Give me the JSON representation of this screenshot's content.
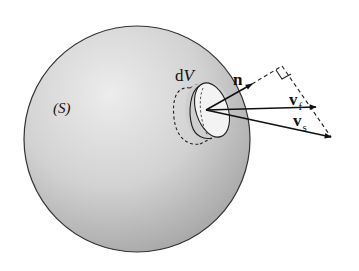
{
  "figure": {
    "labels": {
      "surface": "(S)",
      "volume_element_d": "d",
      "volume_element_v": "V",
      "normal": "n",
      "fluid_velocity": "v",
      "fluid_velocity_sub": "f",
      "surface_velocity": "v",
      "surface_velocity_sub": "s"
    },
    "colors": {
      "sphere_fill_light": "#e6e6e6",
      "sphere_fill_dark": "#a8a8a8",
      "outline": "#222222",
      "disk_fill": "#f2f2f2"
    }
  }
}
